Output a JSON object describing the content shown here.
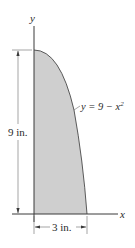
{
  "figure": {
    "axes": {
      "x_label": "x",
      "y_label": "y"
    },
    "curve": {
      "equation_prefix": "y = 9 − x",
      "equation_exponent": "2"
    },
    "dimensions": {
      "height_label": "9 in.",
      "width_label": "3 in."
    },
    "colors": {
      "shaded_region": "#cfcfcf",
      "lines": "#3a3a3a"
    }
  }
}
